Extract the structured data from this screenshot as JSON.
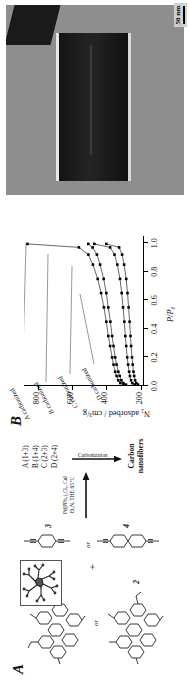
{
  "figure": {
    "panels": [
      "A",
      "B",
      "C"
    ],
    "orientation": "rotated-90-ccw"
  },
  "panel_a": {
    "label": "A",
    "reagents": [
      {
        "id": "1",
        "name": "hexaphenylbenzene-core-monomer",
        "number": "1"
      },
      {
        "id": "2",
        "name": "hexaphenylbenzene-core-monomer-alt",
        "number": "2"
      },
      {
        "id": "3",
        "name": "diethynylbenzene",
        "number": "3"
      },
      {
        "id": "4",
        "name": "diethynylbiphenyl",
        "number": "4"
      }
    ],
    "or_label": "or",
    "plus_label": "+",
    "conditions_line1": "Pd(PPh₃)₂Cl₂, CuI",
    "conditions_line2": "Et₃N, THF, 65 ºC",
    "products": [
      "A (1+3)",
      "B (1+4)",
      "C (2+3)",
      "D (2+4)"
    ],
    "carbonization_label": "Carbonization",
    "final_product_line1": "Carbon",
    "final_product_line2": "nanofibers",
    "inset_caption": "molecular-model-inset"
  },
  "panel_b": {
    "label": "B"
  },
  "chart_data": {
    "type": "scatter",
    "title": "",
    "xlabel": "P/P₀",
    "ylabel": "N₂ adsorbed / cm³/g",
    "xlim": [
      0.0,
      1.05
    ],
    "ylim": [
      180,
      880
    ],
    "xticks": [
      "0.0",
      "0.2",
      "0.4",
      "0.6",
      "0.8",
      "1.0"
    ],
    "xtick_values": [
      0.0,
      0.2,
      0.4,
      0.6,
      0.8,
      1.0
    ],
    "yticks": [
      "200",
      "400",
      "600",
      "800"
    ],
    "ytick_values": [
      200,
      400,
      600,
      800
    ],
    "grid": false,
    "legend": "annotations-with-leader-lines",
    "annotations": [
      "A carbonized",
      "B carbonized",
      "C carbonized",
      "D carbonized"
    ],
    "series": [
      {
        "name": "A carbonized",
        "marker": "square",
        "color": "#000000",
        "x": [
          0.01,
          0.02,
          0.04,
          0.07,
          0.1,
          0.15,
          0.2,
          0.28,
          0.35,
          0.45,
          0.55,
          0.65,
          0.75,
          0.85,
          0.92,
          0.97,
          0.995
        ],
        "y": [
          300,
          318,
          330,
          340,
          348,
          358,
          366,
          378,
          388,
          400,
          414,
          430,
          450,
          478,
          505,
          560,
          860
        ]
      },
      {
        "name": "B carbonized",
        "marker": "square",
        "color": "#000000",
        "x": [
          0.01,
          0.02,
          0.04,
          0.07,
          0.1,
          0.15,
          0.2,
          0.28,
          0.35,
          0.45,
          0.55,
          0.65,
          0.75,
          0.85,
          0.92,
          0.97,
          0.995
        ],
        "y": [
          285,
          300,
          312,
          322,
          330,
          340,
          348,
          358,
          366,
          376,
          388,
          400,
          415,
          436,
          455,
          480,
          505
        ]
      },
      {
        "name": "C carbonized",
        "marker": "square",
        "color": "#000000",
        "x": [
          0.01,
          0.02,
          0.04,
          0.07,
          0.1,
          0.15,
          0.2,
          0.28,
          0.35,
          0.45,
          0.55,
          0.65,
          0.75,
          0.85,
          0.92,
          0.97,
          0.995
        ],
        "y": [
          235,
          248,
          256,
          262,
          267,
          273,
          278,
          284,
          289,
          295,
          302,
          310,
          320,
          336,
          352,
          378,
          470
        ]
      },
      {
        "name": "D carbonized",
        "marker": "square",
        "color": "#000000",
        "x": [
          0.01,
          0.02,
          0.04,
          0.07,
          0.1,
          0.15,
          0.2,
          0.28,
          0.35,
          0.45,
          0.55,
          0.65,
          0.75,
          0.85,
          0.92,
          0.97,
          0.995
        ],
        "y": [
          215,
          225,
          232,
          237,
          241,
          246,
          250,
          255,
          259,
          264,
          270,
          276,
          284,
          296,
          308,
          325,
          400
        ]
      }
    ]
  },
  "panel_c": {
    "label": "C",
    "scale_bar_text": "50 nm",
    "image_description": "tem-micrograph-carbon-nanofiber"
  }
}
